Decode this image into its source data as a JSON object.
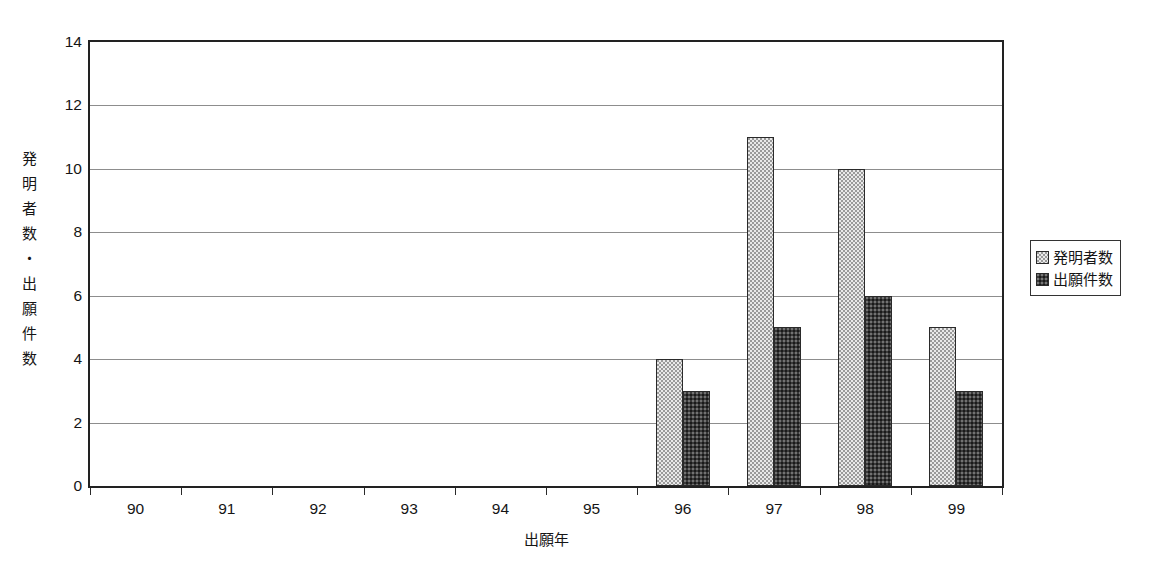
{
  "chart_data": {
    "type": "bar",
    "title": "",
    "subtitle": "",
    "xlabel": "出願年",
    "ylabel": "発明者数・出願件数",
    "categories": [
      "90",
      "91",
      "92",
      "93",
      "94",
      "95",
      "96",
      "97",
      "98",
      "99"
    ],
    "series": [
      {
        "name": "発明者数",
        "values": [
          0,
          0,
          0,
          0,
          0,
          0,
          4,
          11,
          10,
          5
        ],
        "swatch": "light-dotted",
        "color": "#e9e9e9"
      },
      {
        "name": "出願件数",
        "values": [
          0,
          0,
          0,
          0,
          0,
          0,
          3,
          5,
          6,
          3
        ],
        "swatch": "dark-dotted",
        "color": "#3a3a3a"
      }
    ],
    "ylim": [
      0,
      14
    ],
    "y_ticks": [
      0,
      2,
      4,
      6,
      8,
      10,
      12,
      14
    ],
    "y_tick_labels": [
      "0",
      "2",
      "4",
      "6",
      "8",
      "10",
      "12",
      "14"
    ],
    "grid": "horizontal",
    "legend_position": "right",
    "plot_border_color": "#222222",
    "gridline_color": "#8d8d8d",
    "bar_outline_color": "#2a2a2a",
    "background": "#ffffff"
  },
  "legend": {
    "items": [
      {
        "label": "発明者数"
      },
      {
        "label": "出願件数"
      }
    ]
  }
}
